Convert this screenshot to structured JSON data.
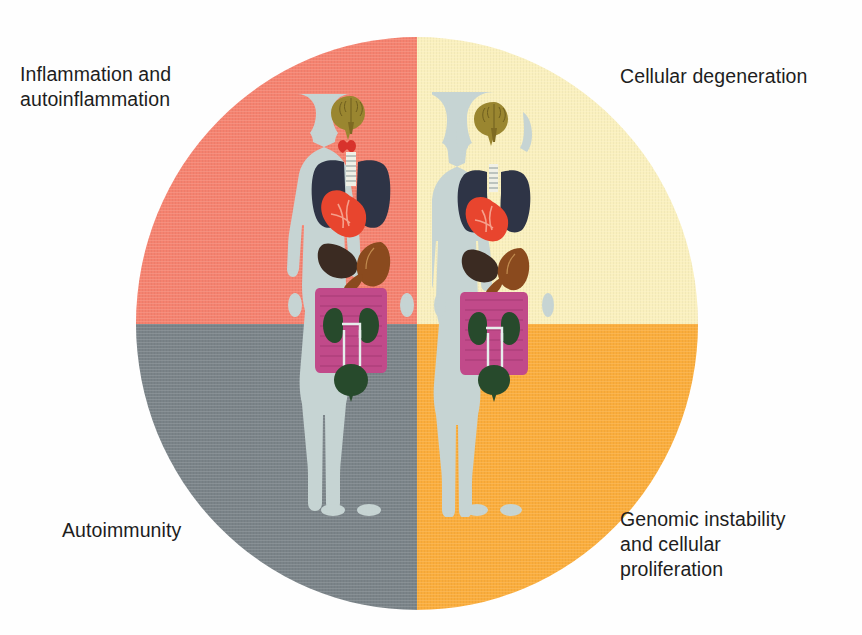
{
  "figure_title": "Quadrant wheel of immune and cellular dysfunction",
  "colors": {
    "quadrant_top_left": "#F58270",
    "quadrant_top_right": "#FAF0BE",
    "quadrant_bottom_left": "#7B8489",
    "quadrant_bottom_right": "#FBAD3C",
    "label_text": "#1d1d1d",
    "background": "#fefefe",
    "body_silhouette": "#C6D4D3",
    "brain": "#9A8630",
    "thyroid": "#D8322C",
    "trachea": "#F0F0E6",
    "lungs": "#2E3446",
    "heart": "#E8452E",
    "liver": "#3B2B22",
    "stomach": "#8A4A1E",
    "intestines": "#C14A8A",
    "kidneys": "#274A2C",
    "bladder": "#274A2C"
  },
  "quadrants": [
    {
      "id": "inflammation",
      "position": "top-left",
      "label": "Inflammation and\nautoinflammation",
      "color": "#F58270"
    },
    {
      "id": "cellular-degeneration",
      "position": "top-right",
      "label": "Cellular degeneration",
      "color": "#FAF0BE"
    },
    {
      "id": "autoimmunity",
      "position": "bottom-left",
      "label": "Autoimmunity",
      "color": "#7B8489"
    },
    {
      "id": "genomic-instability",
      "position": "bottom-right",
      "label": "Genomic instability\nand cellular\nproliferation",
      "color": "#FBAD3C"
    }
  ],
  "figures": [
    {
      "id": "male-figure",
      "name": "male anatomical figure"
    },
    {
      "id": "female-figure",
      "name": "female anatomical figure"
    }
  ],
  "organs": [
    "brain",
    "thyroid",
    "trachea",
    "lungs",
    "heart",
    "liver",
    "stomach",
    "intestines",
    "kidneys",
    "bladder"
  ]
}
